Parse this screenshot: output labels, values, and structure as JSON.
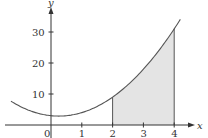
{
  "chart_data": {
    "type": "line",
    "title": "",
    "xlabel": "x",
    "ylabel": "y",
    "function_approx": "y = 2x^2 - x + 3",
    "x": [
      -1.3,
      -1,
      -0.5,
      0,
      0.25,
      0.5,
      1,
      1.5,
      2,
      2.5,
      3,
      3.5,
      4,
      4.2
    ],
    "values": [
      7.7,
      6,
      4,
      3,
      2.9,
      3,
      4,
      6,
      9,
      13,
      18,
      24,
      31,
      34.1
    ],
    "shaded_region": {
      "x_from": 2,
      "x_to": 4,
      "fill": "#e6e6e6",
      "label": "area under curve"
    },
    "xticks": [
      "0",
      "1",
      "2",
      "3",
      "4"
    ],
    "yticks": [
      "10",
      "20",
      "30"
    ],
    "xlim": [
      -1.4,
      4.6
    ],
    "ylim": [
      0,
      38
    ],
    "grid": false,
    "legend": null
  },
  "axes": {
    "x_label": "x",
    "y_label": "y",
    "x_ticks": [
      {
        "value": 0,
        "label": "0"
      },
      {
        "value": 1,
        "label": "1"
      },
      {
        "value": 2,
        "label": "2"
      },
      {
        "value": 3,
        "label": "3"
      },
      {
        "value": 4,
        "label": "4"
      }
    ],
    "y_ticks": [
      {
        "value": 10,
        "label": "10"
      },
      {
        "value": 20,
        "label": "20"
      },
      {
        "value": 30,
        "label": "30"
      }
    ]
  },
  "colors": {
    "curve": "#555555",
    "axis": "#333333",
    "shade": "#e4e4e4"
  }
}
